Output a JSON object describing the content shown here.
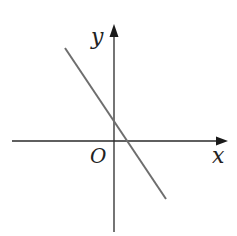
{
  "diagram": {
    "type": "coordinate-plane",
    "axes": {
      "x_label": "x",
      "y_label": "y",
      "origin_label": "O"
    },
    "line": {
      "description": "straight line with negative slope, positive y-intercept, positive x-intercept"
    },
    "colors": {
      "axes": "#2a2a2a",
      "line": "#6e6e6e",
      "labels": "#222222"
    }
  }
}
